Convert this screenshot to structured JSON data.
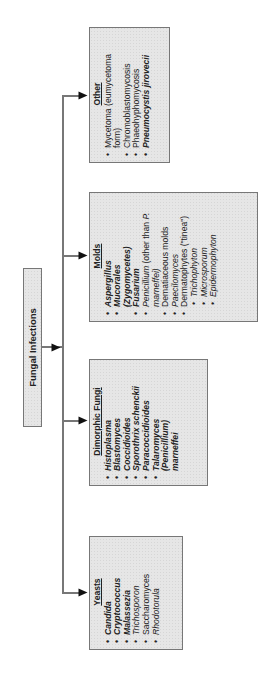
{
  "root": {
    "label": "Fungal Infections"
  },
  "categories": [
    {
      "id": "yeasts",
      "heading": "Yeasts",
      "items": [
        {
          "text": "Candida",
          "style": "bold-italic"
        },
        {
          "text": "Cryptococcus",
          "style": "bold-italic"
        },
        {
          "text": "Malassezia",
          "style": "bold-italic"
        },
        {
          "text": "Trichosporon",
          "style": "italic"
        },
        {
          "text": "Saccharomyces",
          "style": "normal"
        },
        {
          "text": "Rhodotorula",
          "style": "italic"
        }
      ]
    },
    {
      "id": "dimorphic",
      "heading": "Dimorphic Fungi",
      "items": [
        {
          "text": "Histoplasma",
          "style": "bold-italic"
        },
        {
          "text": "Blastomyces",
          "style": "bold-italic"
        },
        {
          "text": "Coccidioides",
          "style": "bold-italic"
        },
        {
          "text": "Sporothrix schenckii",
          "style": "bold-italic"
        },
        {
          "text": "Paracoccidioides",
          "style": "bold-italic"
        },
        {
          "text": "Talaromyces",
          "style": "bold-italic"
        },
        {
          "text": "(Penicillium)",
          "style": "bold-italic",
          "continuation": true
        },
        {
          "text": "marneffei",
          "style": "bold-italic",
          "continuation": true
        }
      ]
    },
    {
      "id": "molds",
      "heading": "Molds",
      "items": [
        {
          "text": "Aspergillus",
          "style": "bold-italic"
        },
        {
          "text": "Mucorales",
          "style": "bold-italic"
        },
        {
          "text": "(Zygomycetes)",
          "style": "bold-italic",
          "continuation": true
        },
        {
          "text": "Fusarium",
          "style": "bold-italic"
        },
        {
          "text": "Penicillium (other than P.",
          "style": "italic-mixed"
        },
        {
          "text": "marneffei)",
          "style": "italic",
          "continuation": true
        },
        {
          "text": "Dematiaceous molds",
          "style": "normal"
        },
        {
          "text": "Paecilomyces",
          "style": "italic"
        },
        {
          "text": "Dermatophytes (\"tinea\")",
          "style": "normal"
        },
        {
          "text": "Trichophyton",
          "style": "italic",
          "sub": true
        },
        {
          "text": "Microsporum",
          "style": "italic",
          "sub": true
        },
        {
          "text": "Epidermophyton",
          "style": "italic",
          "sub": true
        }
      ]
    },
    {
      "id": "other",
      "heading": "Other",
      "items": [
        {
          "text": "Mycetoma (eumycetoma",
          "style": "normal"
        },
        {
          "text": "form)",
          "style": "normal",
          "continuation": true
        },
        {
          "text": "Chromoblastomycosis",
          "style": "normal"
        },
        {
          "text": "Phaeohyphomycosis",
          "style": "normal"
        },
        {
          "text": "Pneumocystis jirovecii",
          "style": "bold-italic"
        }
      ]
    }
  ],
  "text": {
    "yeasts": {
      "h": "Yeasts",
      "i0": "Candida",
      "i1": "Cryptococcus",
      "i2": "Malassezia",
      "i3": "Trichosporon",
      "i4": "Saccharomyces",
      "i5": "Rhodotorula"
    },
    "dimorphic": {
      "h": "Dimorphic Fungi",
      "i0": "Histoplasma",
      "i1": "Blastomyces",
      "i2": "Coccidioides",
      "i3": "Sporothrix schenckii",
      "i4": "Paracoccidioides",
      "i5": "Talaromyces",
      "i5b": "(Penicillium)",
      "i5c": "marneffei"
    },
    "molds": {
      "h": "Molds",
      "i0": "Aspergillus",
      "i1": "Mucorales",
      "i1b": "(Zygomycetes)",
      "i2": "Fusarium",
      "i3a": "Penicillium",
      "i3b": " (other than ",
      "i3c": "P.",
      "i3d": "marneffei)",
      "i4": "Dematiaceous molds",
      "i5": "Paecilomyces",
      "i6": "Dermatophytes (\"tinea\")",
      "i7": "Trichophyton",
      "i8": "Microsporum",
      "i9": "Epidermophyton"
    },
    "other": {
      "h": "Other",
      "i0": "Mycetoma (eumycetoma",
      "i0b": "form)",
      "i1": "Chromoblastomycosis",
      "i2": "Phaeohyphomycosis",
      "i3": "Pneumocystis jirovecii"
    }
  },
  "colors": {
    "box_fill": "#e6e6e6",
    "box_border": "#777777",
    "line": "#777777",
    "arrow": "#111111"
  }
}
